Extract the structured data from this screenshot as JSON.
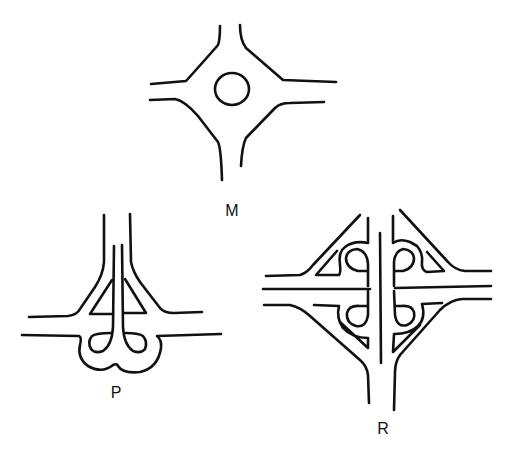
{
  "figure": {
    "background": "#ffffff",
    "stroke_color": "#111111",
    "diagrams": [
      {
        "id": "M",
        "label": "M",
        "type": "roundabout",
        "label_pos": {
          "x": 232,
          "y": 203
        }
      },
      {
        "id": "P",
        "label": "P",
        "type": "trumpet-interchange",
        "label_pos": {
          "x": 116,
          "y": 385
        }
      },
      {
        "id": "R",
        "label": "R",
        "type": "cloverleaf-interchange",
        "label_pos": {
          "x": 383,
          "y": 421
        }
      }
    ]
  }
}
